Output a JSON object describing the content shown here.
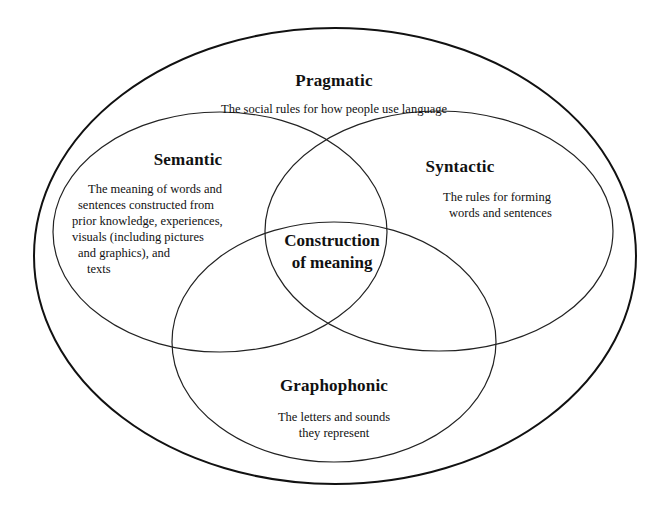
{
  "diagram": {
    "type": "venn",
    "outer": {
      "title": "Pragmatic",
      "description": "The social rules for how people use language"
    },
    "circles": [
      {
        "title": "Semantic",
        "description_lines": [
          "The meaning of words and",
          "sentences constructed from",
          "prior knowledge, experiences,",
          "visuals (including pictures",
          "and graphics), and",
          "texts"
        ]
      },
      {
        "title": "Syntactic",
        "description_lines": [
          "The rules for forming",
          "words and sentences"
        ]
      },
      {
        "title": "Graphophonic",
        "description_lines": [
          "The letters and sounds",
          "they represent"
        ]
      }
    ],
    "center": {
      "line1": "Construction",
      "line2": "of meaning"
    },
    "colors": {
      "stroke": "#111111",
      "background": "#ffffff"
    }
  }
}
